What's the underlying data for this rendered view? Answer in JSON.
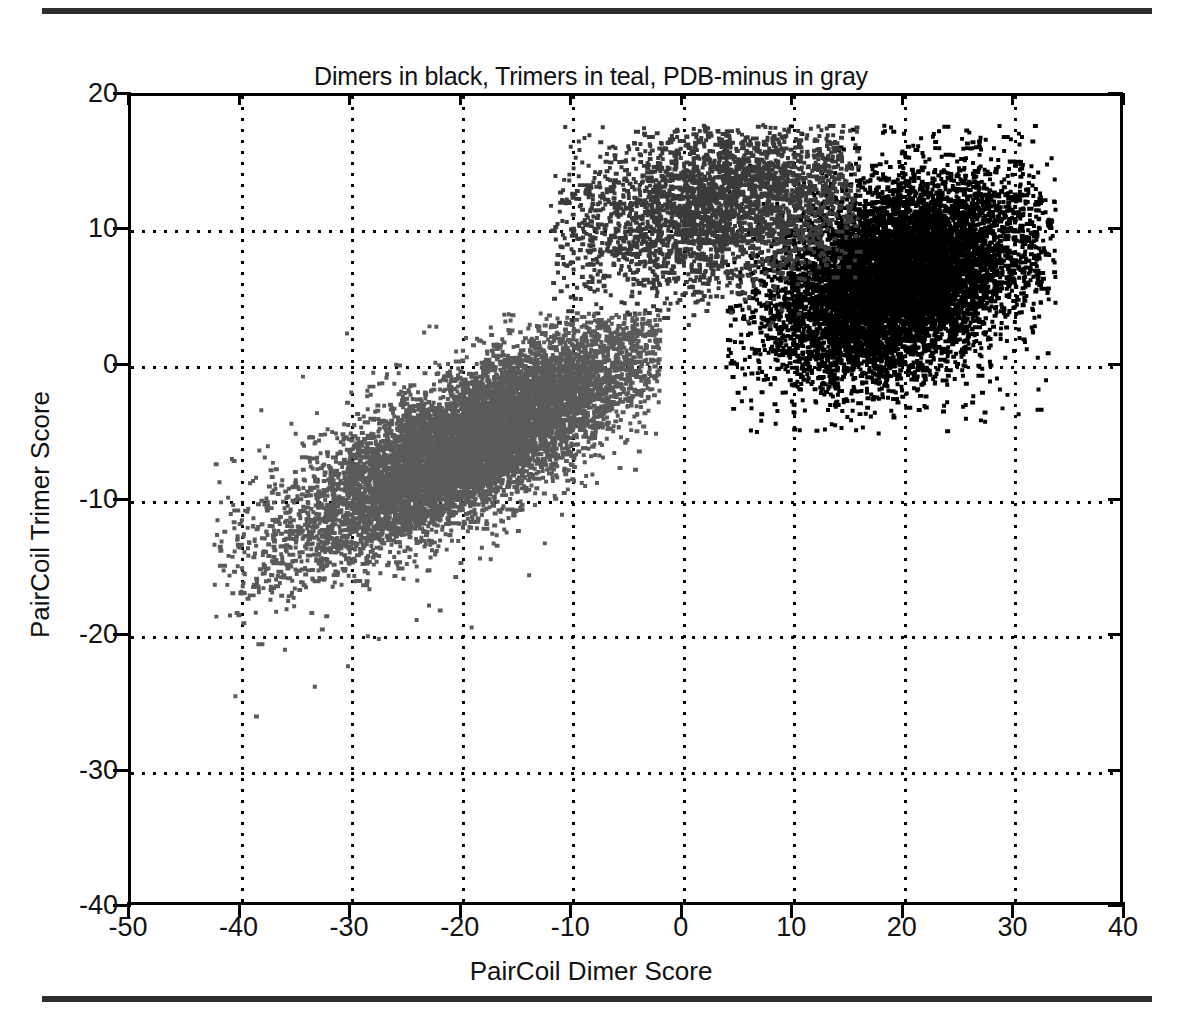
{
  "chart_data": {
    "type": "scatter",
    "title": "Dimers in black, Trimers in teal, PDB-minus in gray",
    "xlabel": "PairCoil Dimer Score",
    "ylabel": "PairCoil Trimer Score",
    "xlim": [
      -50,
      40
    ],
    "ylim": [
      -40,
      20
    ],
    "xticks": [
      -50,
      -40,
      -30,
      -20,
      -10,
      0,
      10,
      20,
      30,
      40
    ],
    "yticks": [
      -40,
      -30,
      -20,
      -10,
      0,
      10,
      20
    ],
    "xtick_labels": [
      "-50",
      "-40",
      "-30",
      "-20",
      "-10",
      "0",
      "10",
      "20",
      "30",
      "40"
    ],
    "ytick_labels": [
      "-40",
      "-30",
      "-20",
      "-10",
      "0",
      "10",
      "20"
    ],
    "grid": true,
    "grid_style": "dotted",
    "legend_position": "in-title",
    "series": [
      {
        "name": "Dimers",
        "color": "#000000",
        "label_in_title": "Dimers in black",
        "n_points": 9000,
        "center": [
          19.5,
          6.5
        ],
        "spread": [
          5.6,
          3.6
        ],
        "correlation": 0.32,
        "x_range": [
          4,
          34
        ],
        "y_range": [
          -5,
          18
        ]
      },
      {
        "name": "Trimers",
        "color": "#3a3a3a",
        "label_in_title": "Trimers in teal",
        "n_points": 3400,
        "center": [
          3.5,
          12.2
        ],
        "spread": [
          7.2,
          3.3
        ],
        "correlation": 0.3,
        "x_range": [
          -12,
          16
        ],
        "y_range": [
          3,
          18
        ]
      },
      {
        "name": "PDB-minus",
        "color": "#5a5a5a",
        "label_in_title": "PDB-minus in gray",
        "n_points": 9500,
        "center": [
          -19.0,
          -5.5
        ],
        "spread": [
          8.2,
          4.2
        ],
        "correlation": 0.8,
        "x_range": [
          -43,
          -2
        ],
        "y_range": [
          -28,
          4
        ]
      }
    ]
  },
  "figure": {
    "top_rule": "",
    "bottom_rule": ""
  }
}
